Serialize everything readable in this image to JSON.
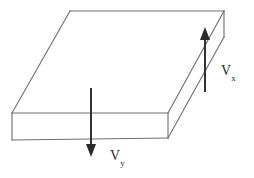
{
  "figure": {
    "name": "slab-velocity-diagram",
    "type": "technical-line-drawing",
    "background_color": "#ffffff",
    "edge_color": "#6e6e6e",
    "arrow_color": "#2b2b2b",
    "width": 254,
    "height": 178
  },
  "labels": {
    "vx": {
      "base": "V",
      "sub": "x"
    },
    "vy": {
      "base": "V",
      "sub": "y"
    }
  },
  "geometry": {
    "top_face": "70,11 224,11 168,113 12,113",
    "right_face": "224,11 224,37 168,138 168,113",
    "front_face": "12,113 168,113 168,138 12,140",
    "edge_top_back": "M 70,11 L 224,11",
    "edge_top_left": "M 70,11 L 12,113",
    "edge_top_right": "M 224,11 L 168,113",
    "edge_top_front": "M 12,113 L 168,113",
    "edge_right_vertical": "M 224,11 L 224,37",
    "edge_right_diag": "M 224,37 L 168,138",
    "edge_front_right_vertical": "M 168,113 L 168,138",
    "edge_front_bottom": "M 12,140 L 168,138",
    "edge_front_left_vertical": "M 12,113 L 12,140"
  },
  "arrows": {
    "vx": {
      "direction": "up",
      "shaft": {
        "x1": 205,
        "y1": 92,
        "x2": 205,
        "y2": 34
      },
      "head": "205,27 200,40 210,40"
    },
    "vy": {
      "direction": "down",
      "shaft": {
        "x1": 91,
        "y1": 88,
        "x2": 91,
        "y2": 149
      },
      "head": "91,157 86,144 96,144"
    }
  }
}
